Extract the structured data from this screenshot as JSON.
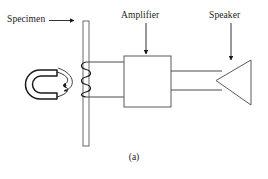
{
  "figure": {
    "caption": "(a)",
    "labels": {
      "specimen": "Specimen",
      "amplifier": "Amplifier",
      "speaker": "Speaker"
    },
    "components": {
      "specimen_rod": "vertical-specimen-rod",
      "horseshoe_magnet": "horseshoe-magnet",
      "field_arrows": "curved-field-arrows",
      "pickup_coil": "pickup-coil",
      "amplifier_box": "amplifier-box",
      "speaker_cone": "speaker-cone",
      "coil_to_amplifier_wires": "two-parallel-wires",
      "amplifier_to_speaker_wires": "two-parallel-wires"
    },
    "colors": {
      "stroke": "#1a1a1a",
      "background": "#ffffff",
      "text": "#1a1a1a"
    }
  }
}
